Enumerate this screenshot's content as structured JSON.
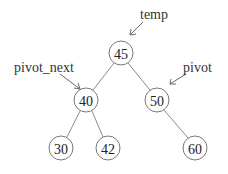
{
  "diagram": {
    "type": "binary-tree",
    "nodes": [
      {
        "id": "n45",
        "value": "45",
        "x": 121,
        "y": 53
      },
      {
        "id": "n40",
        "value": "40",
        "x": 86,
        "y": 100
      },
      {
        "id": "n50",
        "value": "50",
        "x": 157,
        "y": 100
      },
      {
        "id": "n30",
        "value": "30",
        "x": 61,
        "y": 148
      },
      {
        "id": "n42",
        "value": "42",
        "x": 108,
        "y": 148
      },
      {
        "id": "n60",
        "value": "60",
        "x": 195,
        "y": 148
      }
    ],
    "edges": [
      [
        "n45",
        "n40"
      ],
      [
        "n45",
        "n50"
      ],
      [
        "n40",
        "n30"
      ],
      [
        "n40",
        "n42"
      ],
      [
        "n50",
        "n60"
      ]
    ],
    "pointers": [
      {
        "label": "temp",
        "target": "n45"
      },
      {
        "label": "pivot_next",
        "target": "n40"
      },
      {
        "label": "pivot",
        "target": "n50"
      }
    ]
  },
  "labels": {
    "temp": "temp",
    "pivot_next": "pivot_next",
    "pivot": "pivot"
  },
  "nodes": {
    "n45": "45",
    "n40": "40",
    "n50": "50",
    "n30": "30",
    "n42": "42",
    "n60": "60"
  }
}
